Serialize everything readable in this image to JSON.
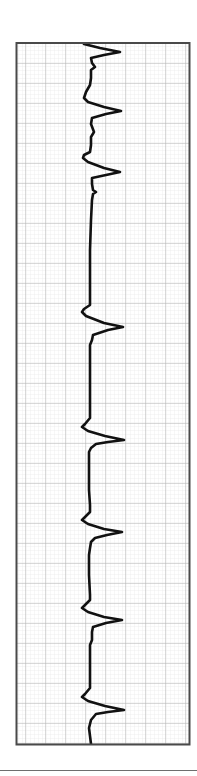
{
  "chart_data": {
    "type": "line",
    "title": "",
    "xlabel": "",
    "ylabel": "",
    "orientation": "vertical-strip",
    "grid": {
      "major_spacing_px": 20,
      "minor_per_major": 5,
      "on": true
    },
    "frame": {
      "x": 17,
      "y": 43,
      "width": 172,
      "height": 701
    },
    "baseline_x": 90,
    "complexes": [
      {
        "index": 1,
        "onset_y": 44,
        "peak_y": 52,
        "peak_amplitude_px": 30
      },
      {
        "index": 2,
        "onset_y": 99,
        "peak_y": 111,
        "peak_amplitude_px": 31
      },
      {
        "index": 3,
        "onset_y": 157,
        "peak_y": 172,
        "peak_amplitude_px": 30
      },
      {
        "index": 4,
        "onset_y": 312,
        "peak_y": 327,
        "peak_amplitude_px": 33
      },
      {
        "index": 5,
        "onset_y": 427,
        "peak_y": 440,
        "peak_amplitude_px": 34
      },
      {
        "index": 6,
        "onset_y": 520,
        "peak_y": 532,
        "peak_amplitude_px": 32
      },
      {
        "index": 7,
        "onset_y": 608,
        "peak_y": 620,
        "peak_amplitude_px": 32
      },
      {
        "index": 8,
        "onset_y": 697,
        "peak_y": 710,
        "peak_amplitude_px": 34
      }
    ],
    "trace_points": [
      [
        84,
        44
      ],
      [
        100,
        48
      ],
      [
        120,
        52
      ],
      [
        104,
        55
      ],
      [
        91,
        58
      ],
      [
        92,
        63
      ],
      [
        95,
        67
      ],
      [
        91,
        70
      ],
      [
        91,
        78
      ],
      [
        90,
        85
      ],
      [
        86,
        92
      ],
      [
        84,
        98
      ],
      [
        88,
        102
      ],
      [
        104,
        107
      ],
      [
        121,
        111
      ],
      [
        106,
        114
      ],
      [
        92,
        118
      ],
      [
        91,
        124
      ],
      [
        94,
        132
      ],
      [
        91,
        137
      ],
      [
        91,
        145
      ],
      [
        90,
        152
      ],
      [
        84,
        155
      ],
      [
        83,
        158
      ],
      [
        88,
        162
      ],
      [
        104,
        168
      ],
      [
        120,
        172
      ],
      [
        106,
        175
      ],
      [
        92,
        178
      ],
      [
        92,
        184
      ],
      [
        93,
        190
      ],
      [
        96,
        192
      ],
      [
        93,
        194
      ],
      [
        92,
        200
      ],
      [
        91,
        220
      ],
      [
        90,
        250
      ],
      [
        90,
        280
      ],
      [
        90,
        300
      ],
      [
        90,
        305
      ],
      [
        84,
        309
      ],
      [
        82,
        312
      ],
      [
        86,
        316
      ],
      [
        104,
        323
      ],
      [
        123,
        327
      ],
      [
        108,
        330
      ],
      [
        93,
        335
      ],
      [
        92,
        340
      ],
      [
        90,
        345
      ],
      [
        90,
        360
      ],
      [
        90,
        380
      ],
      [
        90,
        400
      ],
      [
        90,
        418
      ],
      [
        85,
        424
      ],
      [
        82,
        427
      ],
      [
        88,
        431
      ],
      [
        105,
        436
      ],
      [
        124,
        440
      ],
      [
        108,
        442
      ],
      [
        96,
        444
      ],
      [
        91,
        448
      ],
      [
        89,
        452
      ],
      [
        89,
        470
      ],
      [
        89,
        490
      ],
      [
        90,
        505
      ],
      [
        90,
        512
      ],
      [
        85,
        517
      ],
      [
        82,
        520
      ],
      [
        88,
        524
      ],
      [
        104,
        529
      ],
      [
        122,
        532
      ],
      [
        107,
        535
      ],
      [
        95,
        538
      ],
      [
        91,
        542
      ],
      [
        90,
        548
      ],
      [
        89,
        555
      ],
      [
        89,
        575
      ],
      [
        90,
        595
      ],
      [
        90,
        600
      ],
      [
        85,
        605
      ],
      [
        82,
        608
      ],
      [
        88,
        612
      ],
      [
        104,
        617
      ],
      [
        122,
        620
      ],
      [
        106,
        623
      ],
      [
        93,
        627
      ],
      [
        92,
        632
      ],
      [
        92,
        640
      ],
      [
        90,
        645
      ],
      [
        90,
        660
      ],
      [
        90,
        675
      ],
      [
        90,
        688
      ],
      [
        85,
        694
      ],
      [
        82,
        697
      ],
      [
        88,
        701
      ],
      [
        105,
        706
      ],
      [
        124,
        710
      ],
      [
        108,
        712
      ],
      [
        96,
        714
      ],
      [
        91,
        720
      ],
      [
        89,
        728
      ],
      [
        90,
        736
      ],
      [
        91,
        744
      ]
    ]
  },
  "colors": {
    "background": "#ffffff",
    "frame": "#4a4a4a",
    "major_grid": "#b4b4b4",
    "minor_grid": "#e2e2e2",
    "trace": "#111111",
    "separator": "#6e6e6e"
  }
}
